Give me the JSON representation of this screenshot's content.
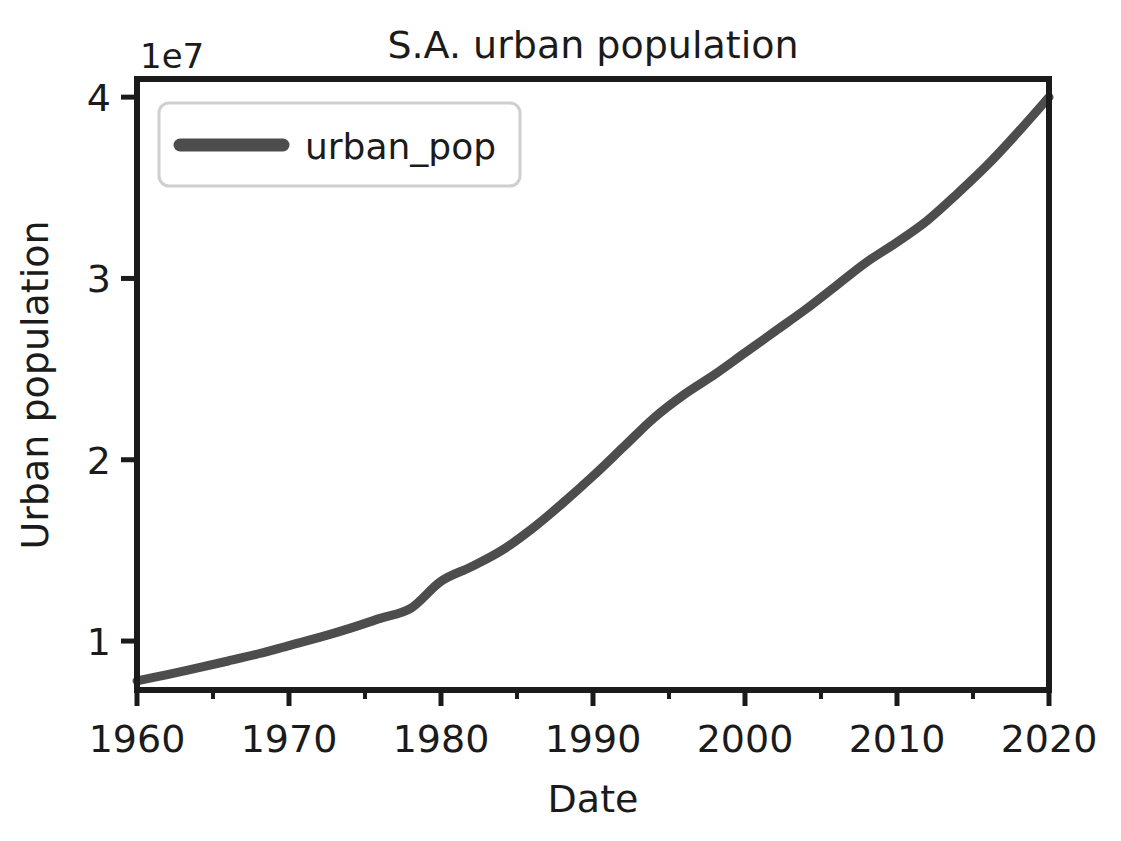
{
  "chart_data": {
    "type": "line",
    "title": "S.A. urban population",
    "xlabel": "Date",
    "ylabel": "Urban population",
    "y_offset_text": "1e7",
    "y_offset_factor": 10000000,
    "xlim": [
      1960,
      2020
    ],
    "ylim": [
      7300000,
      41000000
    ],
    "grid": false,
    "legend_position": "upper left",
    "x_major_ticks": [
      1960,
      1970,
      1980,
      1990,
      2000,
      2010,
      2020
    ],
    "x_major_tick_labels": [
      "1960",
      "1970",
      "1980",
      "1990",
      "2000",
      "2010",
      "2020"
    ],
    "x_minor_ticks": [
      1965,
      1975,
      1985,
      1995,
      2005,
      2015
    ],
    "y_major_ticks": [
      10000000,
      20000000,
      30000000,
      40000000
    ],
    "y_major_tick_labels": [
      "1",
      "2",
      "3",
      "4"
    ],
    "series": [
      {
        "name": "urban_pop",
        "color": "#4d4d4d",
        "linewidth": 9,
        "x": [
          1960,
          1962,
          1964,
          1966,
          1968,
          1970,
          1972,
          1974,
          1976,
          1978,
          1980,
          1982,
          1984,
          1986,
          1988,
          1990,
          1992,
          1994,
          1996,
          1998,
          2000,
          2002,
          2004,
          2006,
          2008,
          2010,
          2012,
          2014,
          2016,
          2018,
          2020
        ],
        "values": [
          7800000,
          8150000,
          8520000,
          8900000,
          9300000,
          9750000,
          10200000,
          10700000,
          11250000,
          11800000,
          13300000,
          14100000,
          15000000,
          16200000,
          17600000,
          19100000,
          20700000,
          22300000,
          23600000,
          24700000,
          25900000,
          27100000,
          28300000,
          29600000,
          30900000,
          32000000,
          33200000,
          34700000,
          36300000,
          38100000,
          40000000
        ]
      }
    ]
  },
  "legend": {
    "entries": [
      {
        "label": "urban_pop",
        "color": "#4d4d4d"
      }
    ]
  },
  "icons": {
    "line_swatch": "line-swatch-icon"
  }
}
